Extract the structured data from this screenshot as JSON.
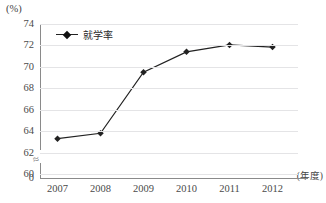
{
  "chart_data": {
    "type": "line",
    "title": "",
    "subtitle": "",
    "xlabel": "(年度)",
    "ylabel": "(%)",
    "categories": [
      "2007",
      "2008",
      "2009",
      "2010",
      "2011",
      "2012"
    ],
    "series": [
      {
        "name": "就学率",
        "values": [
          63.3,
          63.8,
          69.5,
          71.4,
          72.05,
          71.85
        ],
        "color": "#222222",
        "marker": "diamond"
      }
    ],
    "ylim": [
      60,
      74
    ],
    "ytick_labels": [
      "74",
      "72",
      "70",
      "68",
      "66",
      "64",
      "62",
      "60"
    ],
    "ytick_values": [
      74,
      72,
      70,
      68,
      66,
      64,
      62,
      60
    ],
    "zero_tick_label": "0",
    "axis_break": true,
    "axis_break_symbol": "≈",
    "grid": true,
    "grid_axis": "y",
    "legend_position": "top-left",
    "legend_entries": [
      "就学率"
    ]
  },
  "axes": {
    "y_unit_label": "(%)",
    "x_unit_label": "(年度)"
  },
  "colors": {
    "line": "#222222",
    "grid": "#e4e4e6",
    "axis": "#8a8a8a",
    "text": "#4a4a4a",
    "background": "#ffffff"
  }
}
